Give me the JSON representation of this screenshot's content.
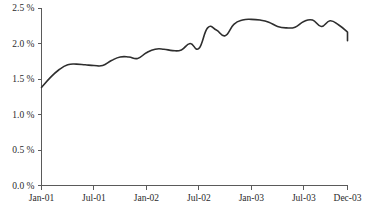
{
  "chart_data": {
    "type": "line",
    "title": "",
    "subtitle": "",
    "xlabel": "",
    "ylabel": "",
    "ylim": [
      0.0,
      2.5
    ],
    "grid": false,
    "legend": "none",
    "y_tick_labels": [
      "2.5 %",
      "2.0 %",
      "1.5 %",
      "1.0 %",
      "0.5 %",
      "0.0 %"
    ],
    "y_tick_values": [
      2.5,
      2.0,
      1.5,
      1.0,
      0.5,
      0.0
    ],
    "x_tick_labels": [
      "Jan-01",
      "Jul-01",
      "Jan-02",
      "Jul-02",
      "Jan-03",
      "Jul-03",
      "Dec-03"
    ],
    "x_tick_indices": [
      0,
      6,
      12,
      18,
      24,
      30,
      35
    ],
    "x": [
      "Jan-01",
      "Feb-01",
      "Mar-01",
      "Apr-01",
      "May-01",
      "Jun-01",
      "Jul-01",
      "Aug-01",
      "Sep-01",
      "Oct-01",
      "Nov-01",
      "Dec-01",
      "Jan-02",
      "Feb-02",
      "Mar-02",
      "Apr-02",
      "May-02",
      "Jun-02",
      "Jul-02",
      "Aug-02",
      "Sep-02",
      "Oct-02",
      "Nov-02",
      "Dec-02",
      "Jan-03",
      "Feb-03",
      "Mar-03",
      "Apr-03",
      "May-03",
      "Jun-03",
      "Jul-03",
      "Aug-03",
      "Sep-03",
      "Oct-03",
      "Nov-03",
      "Dec-03"
    ],
    "values": [
      1.38,
      1.52,
      1.63,
      1.7,
      1.71,
      1.7,
      1.69,
      1.69,
      1.76,
      1.81,
      1.81,
      1.79,
      1.87,
      1.92,
      1.92,
      1.9,
      1.91,
      2.0,
      1.93,
      2.22,
      2.19,
      2.11,
      2.27,
      2.33,
      2.34,
      2.33,
      2.3,
      2.24,
      2.22,
      2.23,
      2.31,
      2.33,
      2.24,
      2.32,
      2.26,
      2.16
    ],
    "series_name": "rate",
    "line_color": "#2e2e2e",
    "axis_color": "#5a5a5a",
    "background_color": "#ffffff",
    "tail_values": [
      2.13,
      2.13,
      2.14,
      2.04
    ],
    "value_unit": "%"
  },
  "axis": {
    "y_axis_name": "percent-axis",
    "x_axis_name": "month-axis"
  }
}
